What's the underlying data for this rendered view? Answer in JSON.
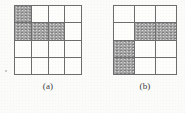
{
  "page": {
    "background_color": "#fbfbfa",
    "line_color": "#6d6d6d",
    "shade_color": "#a5a5a5"
  },
  "figures": [
    {
      "id": "a",
      "caption": "(a)",
      "columns": 4,
      "rows": 4,
      "shaded_cells": [
        {
          "row": 1,
          "col": 1
        },
        {
          "row": 2,
          "col": 1
        },
        {
          "row": 2,
          "col": 2
        },
        {
          "row": 2,
          "col": 3
        }
      ],
      "shaded_count": 4
    },
    {
      "id": "b",
      "caption": "(b)",
      "columns": 3,
      "rows": 4,
      "shaded_cells": [
        {
          "row": 2,
          "col": 2
        },
        {
          "row": 2,
          "col": 3
        },
        {
          "row": 3,
          "col": 1
        },
        {
          "row": 4,
          "col": 1
        }
      ],
      "shaded_count": 4
    }
  ]
}
